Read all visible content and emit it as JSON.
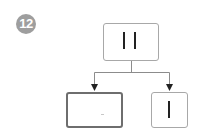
{
  "badge": {
    "label": "12",
    "color": "#9e9e9e"
  },
  "diagram": {
    "type": "tree",
    "root": {
      "id": "top",
      "label": "II",
      "bars": 2
    },
    "children": [
      {
        "id": "left",
        "label": "",
        "bars": 0,
        "highlighted": true,
        "mark": "-"
      },
      {
        "id": "right",
        "label": "I",
        "bars": 1
      }
    ],
    "edges": [
      {
        "from": "top",
        "to": "left",
        "arrow": true
      },
      {
        "from": "top",
        "to": "right",
        "arrow": true
      }
    ],
    "colors": {
      "border": "#a8a8a8",
      "highlight_border": "#6e6e6e",
      "line": "#8c8c8c",
      "bar": "#222222"
    }
  }
}
